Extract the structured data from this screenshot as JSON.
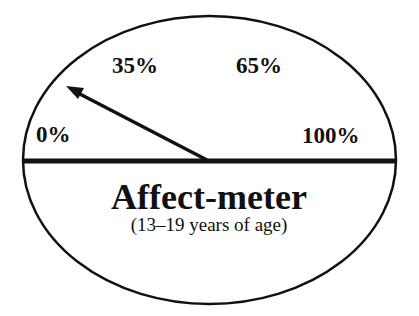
{
  "diagram": {
    "title": "Affect-meter",
    "subtitle": "(13–19 years of age)",
    "scale_labels": {
      "min": "0%",
      "low": "35%",
      "high": "65%",
      "max": "100%"
    },
    "needle_points_to": "35%",
    "colors": {
      "stroke": "#111111",
      "background": "#ffffff"
    }
  }
}
